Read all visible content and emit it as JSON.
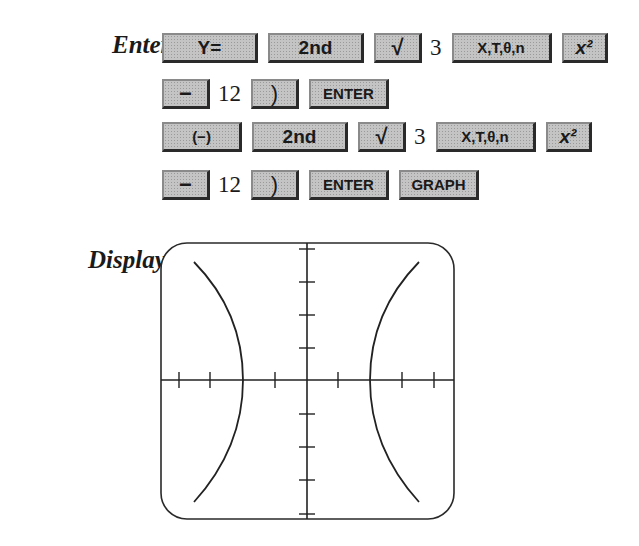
{
  "labels": {
    "enter": "Enter:",
    "display": "Display:"
  },
  "keystrokes": [
    [
      {
        "type": "key",
        "label": "Y=",
        "size": "wide"
      },
      {
        "type": "key",
        "label": "2nd",
        "size": "wide"
      },
      {
        "type": "key",
        "label": "√",
        "size": "sm"
      },
      {
        "type": "num",
        "label": "3"
      },
      {
        "type": "key",
        "label": "X,T,θ,n",
        "size": "xt"
      },
      {
        "type": "key",
        "label": "x²",
        "size": "x2"
      }
    ],
    [
      {
        "type": "key",
        "label": "−",
        "size": "sm"
      },
      {
        "type": "num",
        "label": "12"
      },
      {
        "type": "key",
        "label": ")",
        "size": "sm"
      },
      {
        "type": "key",
        "label": "ENTER",
        "size": "mid"
      }
    ],
    [
      {
        "type": "key",
        "label": "(−)",
        "size": "mid"
      },
      {
        "type": "key",
        "label": "2nd",
        "size": "wide"
      },
      {
        "type": "key",
        "label": "√",
        "size": "sm"
      },
      {
        "type": "num",
        "label": "3"
      },
      {
        "type": "key",
        "label": "X,T,θ,n",
        "size": "xt"
      },
      {
        "type": "key",
        "label": "x²",
        "size": "x2"
      }
    ],
    [
      {
        "type": "key",
        "label": "−",
        "size": "sm"
      },
      {
        "type": "num",
        "label": "12"
      },
      {
        "type": "key",
        "label": ")",
        "size": "sm"
      },
      {
        "type": "key",
        "label": "ENTER",
        "size": "mid"
      },
      {
        "type": "key",
        "label": "GRAPH",
        "size": "mid"
      }
    ]
  ],
  "graph": {
    "description": "Hyperbola y = ±sqrt(3x² − 12) displayed on calculator screen",
    "x_ticks": 8,
    "y_ticks": 8,
    "vertices": [
      -2,
      2
    ]
  }
}
